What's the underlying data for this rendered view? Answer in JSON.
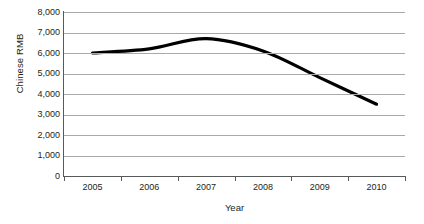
{
  "chart_data": {
    "type": "line",
    "title": "",
    "xlabel": "Year",
    "ylabel": "Chinese RMB",
    "categories": [
      "2005",
      "2006",
      "2007",
      "2008",
      "2009",
      "2010"
    ],
    "values": [
      6000,
      6200,
      6700,
      6100,
      4800,
      3500
    ],
    "series": [
      {
        "name": "Chinese RMB",
        "values": [
          6000,
          6200,
          6700,
          6100,
          4800,
          3500
        ],
        "color": "#000000"
      }
    ],
    "ylim": [
      0,
      8000
    ],
    "ytick_values": [
      8000,
      7000,
      6000,
      5000,
      4000,
      3000,
      2000,
      1000,
      0
    ],
    "ytick_labels": [
      "8,000",
      "7,000",
      "6,000",
      "5,000",
      "4,000",
      "3,000",
      "2,000",
      "1,000",
      "0"
    ],
    "grid": true,
    "grid_color": "#a7a9ac",
    "axis_color": "#58595b",
    "legend": false,
    "smoothed": true
  },
  "axes": {
    "y_title": "Chinese RMB",
    "x_title": "Year"
  }
}
